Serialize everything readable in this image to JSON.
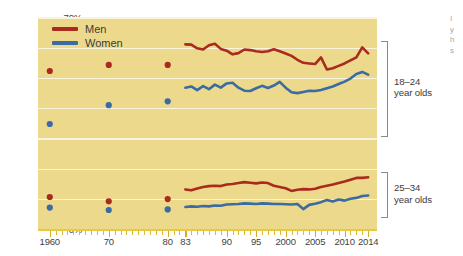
{
  "chart_data": {
    "type": "line",
    "title": "",
    "subtitle": "",
    "xlabel": "",
    "ylabel": "",
    "ylim": [
      0,
      70
    ],
    "xlim": [
      1958,
      2015.5
    ],
    "grid": true,
    "y_ticks": [
      0,
      10,
      20,
      30,
      40,
      50,
      60,
      70
    ],
    "y_tick_labels": [
      "0%",
      "10%",
      "20%",
      "30%",
      "40%",
      "50%",
      "60%",
      "70%"
    ],
    "x_tick_labels": [
      {
        "value": 1960,
        "label": "1960"
      },
      {
        "value": 1970,
        "label": "70"
      },
      {
        "value": 1980,
        "label": "80"
      },
      {
        "value": 1983,
        "label": "83"
      },
      {
        "value": 1990,
        "label": "90"
      },
      {
        "value": 1995,
        "label": "95"
      },
      {
        "value": 2000,
        "label": "2000"
      },
      {
        "value": 2005,
        "label": "2005"
      },
      {
        "value": 2010,
        "label": "2010"
      },
      {
        "value": 2014,
        "label": "2014"
      }
    ],
    "legend": {
      "position": "top-left",
      "entries": [
        {
          "name": "Men",
          "color": "#a82b1e"
        },
        {
          "name": "Women",
          "color": "#3a6ba5"
        }
      ]
    },
    "annotations": [
      {
        "id": "group-18-24",
        "label": "18–24\nyear olds",
        "bracket_from_pct": 62.5,
        "bracket_to_pct": 31.5
      },
      {
        "id": "group-25-34",
        "label": "25–34\nyear olds",
        "bracket_from_pct": 19.0,
        "bracket_to_pct": 4.5
      }
    ],
    "groups": [
      {
        "name": "18–24 year olds",
        "series": [
          {
            "name": "Men",
            "color": "#a82b1e",
            "markers": [
              {
                "x": 1960,
                "y": 52.5
              },
              {
                "x": 1970,
                "y": 54.5
              },
              {
                "x": 1980,
                "y": 54.5
              }
            ],
            "x": [
              1983,
              1984,
              1985,
              1986,
              1987,
              1988,
              1989,
              1990,
              1991,
              1992,
              1993,
              1994,
              1995,
              1996,
              1997,
              1998,
              1999,
              2000,
              2001,
              2002,
              2003,
              2004,
              2005,
              2006,
              2007,
              2008,
              2009,
              2010,
              2011,
              2012,
              2013,
              2014
            ],
            "values": [
              61.3,
              61.2,
              60.0,
              59.6,
              61.0,
              61.5,
              59.8,
              59.2,
              58.0,
              58.4,
              59.6,
              59.4,
              59.0,
              58.8,
              59.0,
              59.7,
              59.0,
              58.3,
              57.5,
              56.2,
              55.2,
              55.0,
              54.8,
              57.0,
              53.0,
              53.4,
              54.2,
              55.0,
              56.0,
              57.0,
              60.3,
              58.3
            ]
          },
          {
            "name": "Women",
            "color": "#3a6ba5",
            "markers": [
              {
                "x": 1960,
                "y": 35.0
              },
              {
                "x": 1970,
                "y": 41.2
              },
              {
                "x": 1980,
                "y": 42.5
              }
            ],
            "x": [
              1983,
              1984,
              1985,
              1986,
              1987,
              1988,
              1989,
              1990,
              1991,
              1992,
              1993,
              1994,
              1995,
              1996,
              1997,
              1998,
              1999,
              2000,
              2001,
              2002,
              2003,
              2004,
              2005,
              2006,
              2007,
              2008,
              2009,
              2010,
              2011,
              2012,
              2013,
              2014
            ],
            "values": [
              47.0,
              47.4,
              46.2,
              47.5,
              46.5,
              48.0,
              47.0,
              48.4,
              48.6,
              47.0,
              46.0,
              45.9,
              46.8,
              47.6,
              46.9,
              47.7,
              48.9,
              47.0,
              45.5,
              45.2,
              45.6,
              46.0,
              45.9,
              46.2,
              46.8,
              47.4,
              48.2,
              49.0,
              50.0,
              51.5,
              52.2,
              51.3
            ]
          }
        ]
      },
      {
        "name": "25–34 year olds",
        "series": [
          {
            "name": "Men",
            "color": "#a82b1e",
            "markers": [
              {
                "x": 1960,
                "y": 10.9
              },
              {
                "x": 1970,
                "y": 9.5
              },
              {
                "x": 1980,
                "y": 10.2
              }
            ],
            "x": [
              1983,
              1984,
              1985,
              1986,
              1987,
              1988,
              1989,
              1990,
              1991,
              1992,
              1993,
              1994,
              1995,
              1996,
              1997,
              1998,
              1999,
              2000,
              2001,
              2002,
              2003,
              2004,
              2005,
              2006,
              2007,
              2008,
              2009,
              2010,
              2011,
              2012,
              2013,
              2014
            ],
            "values": [
              13.4,
              13.1,
              13.7,
              14.2,
              14.5,
              14.6,
              14.5,
              15.0,
              15.2,
              15.5,
              15.8,
              15.6,
              15.4,
              15.7,
              15.5,
              14.6,
              14.2,
              13.8,
              12.9,
              13.3,
              13.5,
              13.4,
              13.6,
              14.2,
              14.6,
              15.0,
              15.5,
              16.0,
              16.6,
              17.2,
              17.2,
              17.4
            ]
          },
          {
            "name": "Women",
            "color": "#3a6ba5",
            "markers": [
              {
                "x": 1960,
                "y": 7.4
              },
              {
                "x": 1970,
                "y": 6.6
              },
              {
                "x": 1980,
                "y": 6.8
              }
            ],
            "x": [
              1983,
              1984,
              1985,
              1986,
              1987,
              1988,
              1989,
              1990,
              1991,
              1992,
              1993,
              1994,
              1995,
              1996,
              1997,
              1998,
              1999,
              2000,
              2001,
              2002,
              2003,
              2004,
              2005,
              2006,
              2007,
              2008,
              2009,
              2010,
              2011,
              2012,
              2013,
              2014
            ],
            "values": [
              7.6,
              7.8,
              7.7,
              7.9,
              7.8,
              8.1,
              8.0,
              8.4,
              8.5,
              8.6,
              8.8,
              8.7,
              8.6,
              8.8,
              8.7,
              8.6,
              8.6,
              8.5,
              8.4,
              8.6,
              6.9,
              8.3,
              8.7,
              9.2,
              9.9,
              9.4,
              10.1,
              9.7,
              10.3,
              10.6,
              11.2,
              11.4
            ]
          }
        ]
      }
    ]
  },
  "cutoff_text": {
    "line1": "I",
    "line2": "y",
    "line3": "h",
    "line4": "s"
  }
}
